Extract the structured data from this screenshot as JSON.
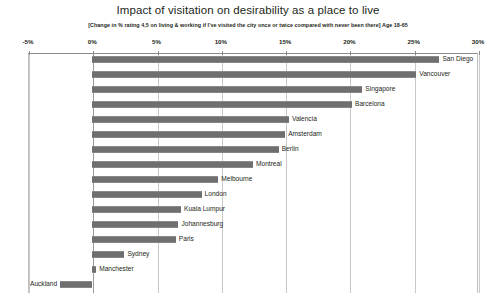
{
  "chart_data": {
    "type": "bar",
    "orientation": "horizontal",
    "title": "Impact of visitation on desirability as a place to live",
    "subtitle": "[Change in % rating 4,5 on living & working if I've visited the city once or twice compared with never been there] Age 18-65",
    "xlabel": "",
    "ylabel": "",
    "xlim": [
      -5,
      30
    ],
    "xticks": [
      -5,
      0,
      5,
      10,
      15,
      20,
      25,
      30
    ],
    "xtick_labels": [
      "-5%",
      "0%",
      "5%",
      "10%",
      "15%",
      "20%",
      "25%",
      "30%"
    ],
    "grid": true,
    "legend": "none",
    "bar_color": "#6f6f6f",
    "value_unit": "%",
    "categories": [
      "San Diego",
      "Vancouver",
      "Singapore",
      "Barcelona",
      "Valencia",
      "Amsterdam",
      "Berlin",
      "Montreal",
      "Melbourne",
      "London",
      "Kuala Lumpur",
      "Johannesburg",
      "Paris",
      "Sydney",
      "Manchester",
      "Auckland"
    ],
    "values": [
      27.0,
      25.2,
      21.0,
      20.2,
      15.3,
      15.0,
      14.5,
      12.5,
      9.8,
      8.5,
      6.9,
      6.7,
      6.5,
      2.5,
      0.3,
      -2.5
    ]
  }
}
